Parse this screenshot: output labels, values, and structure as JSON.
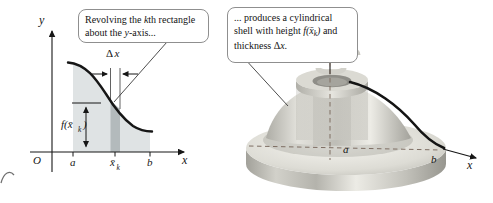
{
  "colors": {
    "shade_region": "#dfe3e4",
    "kth_strip": "#b3babc",
    "dashed_line": "#7e6e63",
    "curve": "#161616",
    "box_border": "#8f8f8f",
    "solid_light": "#f3f2ed",
    "solid_dark": "#9b9a93"
  },
  "callout_left": {
    "line1": {
      "t1": "Revolving the ",
      "k": "k",
      "t2": "th rectangle"
    },
    "line2": {
      "t1": "about the ",
      "y": "y",
      "t2": "-axis..."
    }
  },
  "callout_right": {
    "line1": {
      "t1": "... produces a cylindrical"
    },
    "line2": {
      "t1": "shell with height ",
      "m1": "f(x̄",
      "sub": "k",
      "m2": ")",
      "t2": " and"
    },
    "line3": {
      "t1": "thickness Δ",
      "m1": "x",
      "t2": "."
    }
  },
  "left_graph": {
    "y_axis_label": "y",
    "x_axis_label": "x",
    "origin_label": "O",
    "tick_a": "a",
    "tick_xbar": "x̄",
    "tick_xbar_sub": "k",
    "tick_b": "b",
    "delta_label": "Δ",
    "delta_var": "x",
    "height_label_main": "f(x̄",
    "height_label_sub": "k",
    "height_label_close": ")"
  },
  "right_figure": {
    "y_axis_label": "y",
    "x_axis_label": "x",
    "label_a": "a",
    "label_b": "b",
    "icons": {
      "rotation": "rotation-arrow"
    }
  }
}
